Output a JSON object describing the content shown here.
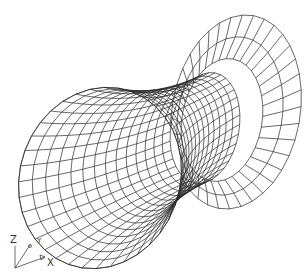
{
  "viewport": {
    "title": "Wireframe hyperboloid tube",
    "background": "#ffffff",
    "line_color": "#2a2a2a"
  },
  "model": {
    "type": "surface-of-revolution wireframe",
    "circumferential_segments": 36,
    "back_flange_radial_rings": 3,
    "tube_rings": 14
  },
  "ucs_icon": {
    "z_label": "Z",
    "y_label": "Y",
    "x_label": "X"
  }
}
